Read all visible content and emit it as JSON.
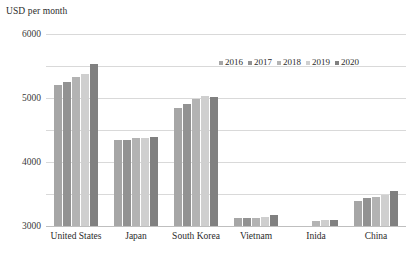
{
  "chart": {
    "axis_title": "USD per month",
    "legend_position": "top-right"
  },
  "chart_data": {
    "type": "bar",
    "title": "",
    "subtitle": "",
    "xlabel": "",
    "ylabel": "USD per month",
    "ylim": [
      0,
      6000
    ],
    "ytick_labels": [
      "0",
      "1000",
      "2000",
      "3000",
      "4000",
      "5000",
      "6000"
    ],
    "ytick_values": [
      0,
      1000,
      2000,
      3000,
      4000,
      5000,
      6000
    ],
    "grid": true,
    "legend": [
      "2016",
      "2017",
      "2018",
      "2019",
      "2020"
    ],
    "categories": [
      "United States",
      "Japan",
      "South Korea",
      "Vietnam",
      "Inida",
      "China"
    ],
    "series": [
      {
        "name": "2016",
        "color": "#a6a6a6",
        "values": [
          4400,
          2700,
          3700,
          260,
          0,
          780
        ]
      },
      {
        "name": "2017",
        "color": "#929292",
        "values": [
          4500,
          2680,
          3800,
          250,
          0,
          870
        ]
      },
      {
        "name": "2018",
        "color": "#b3b3b3",
        "values": [
          4650,
          2760,
          3980,
          265,
          170,
          920
        ]
      },
      {
        "name": "2019",
        "color": "#cfcfcf",
        "values": [
          4760,
          2750,
          4070,
          275,
          175,
          980
        ]
      },
      {
        "name": "2020",
        "color": "#808080",
        "values": [
          5050,
          2790,
          4020,
          330,
          200,
          1100
        ]
      }
    ]
  }
}
